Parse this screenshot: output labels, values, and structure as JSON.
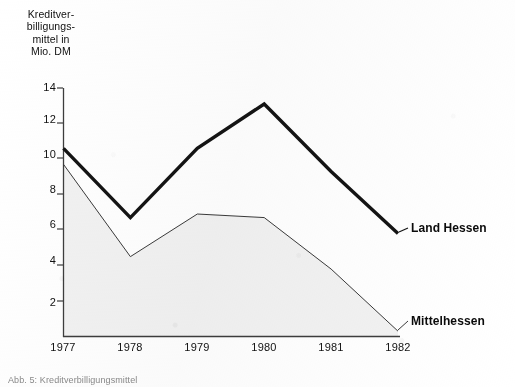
{
  "chart_data": {
    "type": "line",
    "title": "",
    "xlabel": "",
    "ylabel": "Kreditver-\nbilligungs-\nmittel in\nMio. DM",
    "x": [
      "1977",
      "1978",
      "1979",
      "1980",
      "1981",
      "1982"
    ],
    "xtick_labels": [
      "1977",
      "1978",
      "1979",
      "1980",
      "1981",
      "1982"
    ],
    "ytick_labels": [
      "14",
      "12",
      "10",
      "8",
      "6",
      "4",
      "2"
    ],
    "ytick_values": [
      14,
      12,
      10,
      8,
      6,
      4,
      2
    ],
    "ylim": [
      0,
      14
    ],
    "grid": false,
    "legend_position": "inline-right-of-series-end",
    "series": [
      {
        "name": "Land Hessen",
        "label": "Land Hessen",
        "style": "thick",
        "color": "#141414",
        "linewidth": 3.4,
        "values": [
          10.6,
          6.7,
          10.6,
          13.1,
          9.3,
          5.8
        ]
      },
      {
        "name": "Mittelhessen",
        "label": "Mittelhessen",
        "style": "thin",
        "color": "#3a3a3a",
        "linewidth": 1.0,
        "fill": "#f2f2f2",
        "values": [
          9.7,
          4.5,
          6.9,
          6.7,
          3.8,
          0.3
        ]
      }
    ]
  },
  "axes": {
    "y_axis_title_lines": [
      "Kreditver-",
      "billigungs-",
      "mittel in",
      "Mio. DM"
    ],
    "y_axis_title": "Kreditverbilligungsmittel in Mio. DM"
  },
  "caption": {
    "text": "Abb. 5: Kreditverbilligungsmittel"
  },
  "colors": {
    "paper": "#ffffff",
    "ink": "#141414",
    "thin_ink": "#3a3a3a",
    "axis": "#3d3d3d",
    "fill": "#f2f2f2",
    "caption": "#8a8a8a"
  }
}
